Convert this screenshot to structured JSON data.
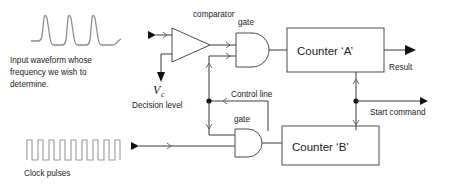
{
  "diagram": {
    "labels": {
      "input_waveform_line1": "Input waveform whose",
      "input_waveform_line2": "frequency we wish to",
      "input_waveform_line3": "determine.",
      "clock_pulses": "Clock pulses",
      "comparator": "comparator",
      "gate_top": "gate",
      "gate_bottom": "gate",
      "counter_a": "Counter ‘A’",
      "counter_b": "Counter ‘B’",
      "result": "Result",
      "vc_symbol": "V",
      "vc_subscript": "c",
      "decision_level": "Decision level",
      "control_line": "Control line",
      "start_command": "Start command"
    },
    "colors": {
      "background": "#ffffff",
      "wire": "#3a3a3a",
      "shape_outline": "#4a4a4a",
      "waveform": "#8d8d8d",
      "clock_waveform": "#9a9a9a",
      "text": "#1a1a1a",
      "arrow_solid": "#111111"
    }
  }
}
